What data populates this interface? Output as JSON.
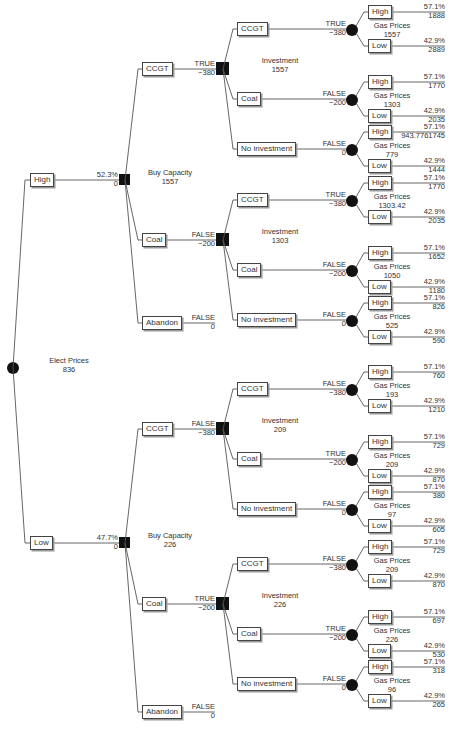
{
  "root": {
    "name": "Elect Prices",
    "value": "836"
  },
  "branches": [
    {
      "label": "High",
      "prob": "52.3%",
      "payoff": "0",
      "decision": {
        "name": "Buy Capacity",
        "value": "1557"
      },
      "options": [
        {
          "label": "CCGT",
          "flag": "TRUE",
          "cost": "−380",
          "investment": {
            "name": "Investment",
            "value": "1557"
          },
          "choices": [
            {
              "label": "CCGT",
              "flag": "TRUE",
              "cost": "−380",
              "gas": {
                "name": "Gas Prices",
                "value": "1557"
              },
              "high": {
                "label": "High",
                "prob": "57.1%",
                "value": "1888"
              },
              "low": {
                "label": "Low",
                "prob": "42.9%",
                "value": "2889"
              }
            },
            {
              "label": "Coal",
              "flag": "FALSE",
              "cost": "−200",
              "gas": {
                "name": "Gas Prices",
                "value": "1303"
              },
              "high": {
                "label": "High",
                "prob": "57.1%",
                "value": "1770"
              },
              "low": {
                "label": "Low",
                "prob": "42.9%",
                "value": "2035"
              }
            },
            {
              "label": "No investment",
              "flag": "FALSE",
              "cost": "0",
              "gas": {
                "name": "Gas Prices",
                "value": "779"
              },
              "high": {
                "label": "High",
                "prob": "57.1%",
                "value": "943.7761745"
              },
              "low": {
                "label": "Low",
                "prob": "42.9%",
                "value": "1444"
              }
            }
          ]
        },
        {
          "label": "Coal",
          "flag": "FALSE",
          "cost": "−200",
          "investment": {
            "name": "Investment",
            "value": "1303"
          },
          "choices": [
            {
              "label": "CCGT",
              "flag": "TRUE",
              "cost": "−380",
              "gas": {
                "name": "Gas Prices",
                "value": "1303.42"
              },
              "high": {
                "label": "High",
                "prob": "57.1%",
                "value": "1770"
              },
              "low": {
                "label": "Low",
                "prob": "42.9%",
                "value": "2035"
              }
            },
            {
              "label": "Coal",
              "flag": "FALSE",
              "cost": "−200",
              "gas": {
                "name": "Gas Prices",
                "value": "1050"
              },
              "high": {
                "label": "High",
                "prob": "57.1%",
                "value": "1652"
              },
              "low": {
                "label": "Low",
                "prob": "42.9%",
                "value": "1180"
              }
            },
            {
              "label": "No investment",
              "flag": "FALSE",
              "cost": "0",
              "gas": {
                "name": "Gas Prices",
                "value": "525"
              },
              "high": {
                "label": "High",
                "prob": "57.1%",
                "value": "826"
              },
              "low": {
                "label": "Low",
                "prob": "42.9%",
                "value": "590"
              }
            }
          ]
        },
        {
          "label": "Abandon",
          "flag": "FALSE",
          "cost": "0"
        }
      ]
    },
    {
      "label": "Low",
      "prob": "47.7%",
      "payoff": "0",
      "decision": {
        "name": "Buy Capacity",
        "value": "226"
      },
      "options": [
        {
          "label": "CCGT",
          "flag": "FALSE",
          "cost": "−380",
          "investment": {
            "name": "Investment",
            "value": "209"
          },
          "choices": [
            {
              "label": "CCGT",
              "flag": "FALSE",
              "cost": "−380",
              "gas": {
                "name": "Gas Prices",
                "value": "193"
              },
              "high": {
                "label": "High",
                "prob": "57.1%",
                "value": "760"
              },
              "low": {
                "label": "Low",
                "prob": "42.9%",
                "value": "1210"
              }
            },
            {
              "label": "Coal",
              "flag": "TRUE",
              "cost": "−200",
              "gas": {
                "name": "Gas Prices",
                "value": "209"
              },
              "high": {
                "label": "High",
                "prob": "57.1%",
                "value": "729"
              },
              "low": {
                "label": "Low",
                "prob": "42.9%",
                "value": "870"
              }
            },
            {
              "label": "No investment",
              "flag": "FALSE",
              "cost": "0",
              "gas": {
                "name": "Gas Prices",
                "value": "97"
              },
              "high": {
                "label": "High",
                "prob": "57.1%",
                "value": "380"
              },
              "low": {
                "label": "Low",
                "prob": "42.9%",
                "value": "605"
              }
            }
          ]
        },
        {
          "label": "Coal",
          "flag": "TRUE",
          "cost": "−200",
          "investment": {
            "name": "Investment",
            "value": "226"
          },
          "choices": [
            {
              "label": "CCGT",
              "flag": "FALSE",
              "cost": "−380",
              "gas": {
                "name": "Gas Prices",
                "value": "209"
              },
              "high": {
                "label": "High",
                "prob": "57.1%",
                "value": "729"
              },
              "low": {
                "label": "Low",
                "prob": "42.9%",
                "value": "870"
              }
            },
            {
              "label": "Coal",
              "flag": "TRUE",
              "cost": "−200",
              "gas": {
                "name": "Gas Prices",
                "value": "226"
              },
              "high": {
                "label": "High",
                "prob": "57.1%",
                "value": "697"
              },
              "low": {
                "label": "Low",
                "prob": "42.9%",
                "value": "530"
              }
            },
            {
              "label": "No investment",
              "flag": "FALSE",
              "cost": "0",
              "gas": {
                "name": "Gas Prices",
                "value": "96"
              },
              "high": {
                "label": "High",
                "prob": "57.1%",
                "value": "318"
              },
              "low": {
                "label": "Low",
                "prob": "42.9%",
                "value": "265"
              }
            }
          ]
        },
        {
          "label": "Abandon",
          "flag": "FALSE",
          "cost": "0"
        }
      ]
    }
  ],
  "colors": {
    "line": "#555555",
    "node": "#111111",
    "text": "#333333"
  }
}
